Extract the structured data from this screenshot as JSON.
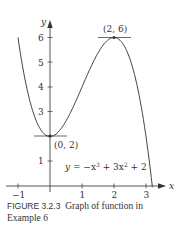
{
  "figure": {
    "label": "FIGURE 3.2.3",
    "caption": "Graph of function in Example 6"
  },
  "chart_data": {
    "type": "line",
    "equation": "y = −x³ + 3x² + 2",
    "xlabel": "x",
    "ylabel": "y",
    "x_ticks": [
      -1,
      1,
      2,
      3
    ],
    "y_ticks": [
      1,
      2,
      3,
      4,
      5,
      6
    ],
    "xlim": [
      -1.1,
      3.6
    ],
    "ylim": [
      0,
      6.6
    ],
    "domain": [
      -1.0,
      3.2
    ],
    "annotations": [
      {
        "point": [
          0,
          2
        ],
        "label": "(0, 2)",
        "tangent": "horizontal"
      },
      {
        "point": [
          2,
          6
        ],
        "label": "(2, 6)",
        "tangent": "horizontal"
      }
    ],
    "grid": false
  },
  "tick_labels": {
    "x": [
      "−1",
      "1",
      "2",
      "3"
    ],
    "y": [
      "1",
      "2",
      "3",
      "4",
      "5",
      "6"
    ]
  },
  "labels": {
    "x_axis": "x",
    "y_axis": "y",
    "equation_y": "y",
    "equation_rest": " = −x",
    "equation_exp1": "3",
    "equation_mid": " + 3x",
    "equation_exp2": "2",
    "equation_end": " + 2",
    "min_point": "(0, 2)",
    "max_point": "(2, 6)"
  }
}
